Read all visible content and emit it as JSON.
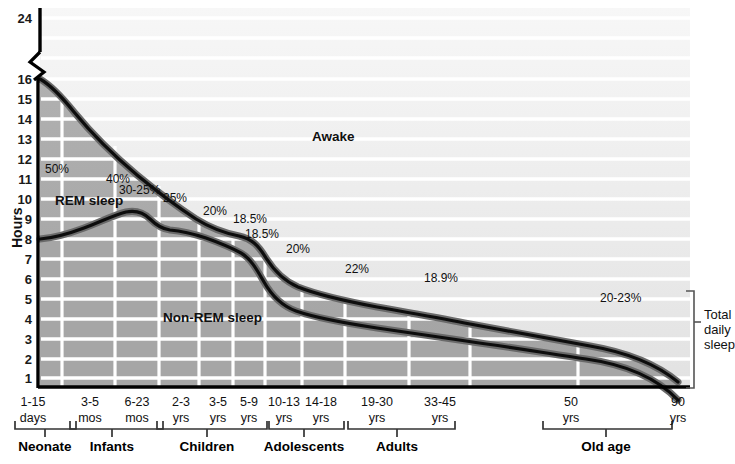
{
  "chart_data": {
    "type": "area",
    "ylabel": "Hours",
    "xlabel": "",
    "ylim": [
      0,
      16
    ],
    "y_break": {
      "from": 16,
      "to": 24,
      "note": "axis break between 16 and 24"
    },
    "yticks": [
      24,
      16,
      15,
      14,
      13,
      12,
      11,
      10,
      9,
      8,
      7,
      6,
      5,
      4,
      3,
      2,
      1
    ],
    "grid": "horizontal-and-vertical",
    "legend_position": "inline-annotations",
    "regions": [
      {
        "name": "Awake",
        "label": "Awake",
        "fill": "#efefef"
      },
      {
        "name": "REM sleep",
        "label": "REM sleep",
        "fill": "#a8a8a8"
      },
      {
        "name": "Non-REM sleep",
        "label": "Non-REM sleep",
        "fill": "#a8a8a8"
      }
    ],
    "series": [
      {
        "name": "Total daily sleep",
        "description": "Upper boundary: total hours of sleep per day",
        "x_labels": [
          "1-15 days",
          "3-5 mos",
          "6-23 mos",
          "2-3 yrs",
          "3-5 yrs",
          "5-9 yrs",
          "10-13 yrs",
          "14-18 yrs",
          "19-30 yrs",
          "33-45 yrs",
          "50 yrs",
          "90 yrs"
        ],
        "values": [
          16.0,
          14.3,
          13.2,
          12.0,
          11.2,
          10.3,
          9.6,
          8.3,
          7.8,
          7.3,
          6.6,
          5.3
        ]
      },
      {
        "name": "Non-REM sleep",
        "description": "Lower boundary: hours of Non-REM sleep per day",
        "x_labels": [
          "1-15 days",
          "3-5 mos",
          "6-23 mos",
          "2-3 yrs",
          "3-5 yrs",
          "5-9 yrs",
          "10-13 yrs",
          "14-18 yrs",
          "19-30 yrs",
          "33-45 yrs",
          "50 yrs",
          "90 yrs"
        ],
        "values": [
          8.0,
          8.6,
          9.4,
          9.0,
          8.6,
          8.2,
          7.7,
          6.4,
          6.1,
          5.8,
          5.3,
          4.2
        ]
      }
    ],
    "annotations": [
      {
        "text": "50%",
        "meaning": "percent of sleep that is REM",
        "x": 45,
        "y": 163
      },
      {
        "text": "40%",
        "meaning": "percent of sleep that is REM",
        "x": 106,
        "y": 173
      },
      {
        "text": "30-25%",
        "meaning": "percent of sleep that is REM",
        "x": 119,
        "y": 184
      },
      {
        "text": "25%",
        "meaning": "percent of sleep that is REM",
        "x": 163,
        "y": 192
      },
      {
        "text": "20%",
        "meaning": "percent of sleep that is REM",
        "x": 203,
        "y": 205
      },
      {
        "text": "18.5%",
        "meaning": "percent of sleep that is REM",
        "x": 233,
        "y": 213
      },
      {
        "text": "18.5%",
        "meaning": "percent of sleep that is REM",
        "x": 245,
        "y": 228
      },
      {
        "text": "20%",
        "meaning": "percent of sleep that is REM",
        "x": 286,
        "y": 243
      },
      {
        "text": "22%",
        "meaning": "percent of sleep that is REM",
        "x": 345,
        "y": 263
      },
      {
        "text": "18.9%",
        "meaning": "percent of sleep that is REM",
        "x": 424,
        "y": 272
      },
      {
        "text": "20-23%",
        "meaning": "percent of sleep that is REM",
        "x": 600,
        "y": 292
      }
    ]
  },
  "axis": {
    "y_title": "Hours",
    "y_ticks": [
      {
        "label": "24",
        "y": 18
      },
      {
        "label": "16",
        "y": 79
      },
      {
        "label": "15",
        "y": 99
      },
      {
        "label": "14",
        "y": 119
      },
      {
        "label": "13",
        "y": 139
      },
      {
        "label": "12",
        "y": 159
      },
      {
        "label": "11",
        "y": 179
      },
      {
        "label": "10",
        "y": 199
      },
      {
        "label": "9",
        "y": 219
      },
      {
        "label": "8",
        "y": 239
      },
      {
        "label": "7",
        "y": 259
      },
      {
        "label": "6",
        "y": 279
      },
      {
        "label": "5",
        "y": 299
      },
      {
        "label": "4",
        "y": 319
      },
      {
        "label": "3",
        "y": 339
      },
      {
        "label": "2",
        "y": 359
      },
      {
        "label": "1",
        "y": 378
      }
    ],
    "x_ticks": [
      {
        "line1": "1-15",
        "line2": "days",
        "x": 33
      },
      {
        "line1": "3-5",
        "line2": "mos",
        "x": 90
      },
      {
        "line1": "6-23",
        "line2": "mos",
        "x": 137
      },
      {
        "line1": "2-3",
        "line2": "yrs",
        "x": 181
      },
      {
        "line1": "3-5",
        "line2": "yrs",
        "x": 218
      },
      {
        "line1": "5-9",
        "line2": "yrs",
        "x": 249
      },
      {
        "line1": "10-13",
        "line2": "yrs",
        "x": 284
      },
      {
        "line1": "14-18",
        "line2": "yrs",
        "x": 321
      },
      {
        "line1": "19-30",
        "line2": "yrs",
        "x": 377
      },
      {
        "line1": "33-45",
        "line2": "yrs",
        "x": 440
      },
      {
        "line1": "50",
        "line2": "yrs",
        "x": 571
      },
      {
        "line1": "90",
        "line2": "yrs",
        "x": 678
      }
    ]
  },
  "groups": [
    {
      "label": "Neonate",
      "cx": 45,
      "x1": 15,
      "x2": 76
    },
    {
      "label": "Infants",
      "cx": 112,
      "x1": 70,
      "x2": 163
    },
    {
      "label": "Children",
      "cx": 207,
      "x1": 157,
      "x2": 267
    },
    {
      "label": "Adolescents",
      "cx": 304,
      "x1": 269,
      "x2": 344
    },
    {
      "label": "Adults",
      "cx": 397,
      "x1": 348,
      "x2": 455
    },
    {
      "label": "Old age",
      "cx": 606,
      "x1": 543,
      "x2": 672
    }
  ],
  "side_bracket": {
    "line1": "Total",
    "line2": "daily",
    "line3": "sleep"
  },
  "colors": {
    "awake_fill": "#efefef",
    "sleep_fill": "#a9a9a9",
    "rem_fill": "#b4b4b4",
    "curve_stroke": "#101010",
    "curve_halo": "#5f5f5f",
    "gridline": "#ffffff",
    "axis": "#000000"
  }
}
